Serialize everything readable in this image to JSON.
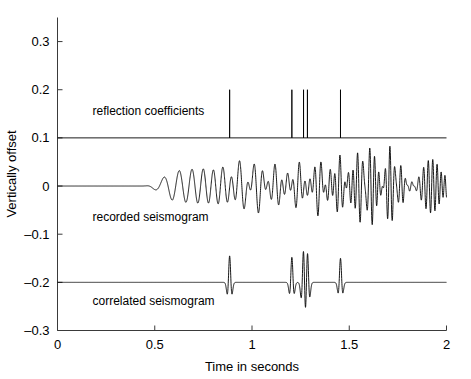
{
  "chart_data": {
    "type": "line",
    "title": "",
    "xlabel": "Time in seconds",
    "ylabel": "Vertically offset",
    "xlim": [
      0,
      2
    ],
    "ylim": [
      -0.3,
      0.35
    ],
    "xticks": [
      0,
      0.5,
      1,
      1.5,
      2
    ],
    "xticklabels": [
      "0",
      "0.5",
      "1",
      "1.5",
      "2"
    ],
    "yticks": [
      0.3,
      0.2,
      0.1,
      0,
      -0.1,
      -0.2,
      -0.3
    ],
    "yticklabels": [
      "0.3",
      "0.2",
      "0.1",
      "0",
      "-0.1",
      "-0.2",
      "-0.3"
    ],
    "grid": false,
    "legend": "none",
    "annotations": [
      {
        "text": "reflection coefficients",
        "x": 0.18,
        "y": 0.148
      },
      {
        "text": "recorded seismogram",
        "x": 0.18,
        "y": -0.072
      },
      {
        "text": "correlated seismogram",
        "x": 0.18,
        "y": -0.247
      }
    ],
    "series": [
      {
        "name": "reflection coefficients",
        "type": "stem",
        "baseline": 0.1,
        "amplitude_scale": 0.1,
        "spikes": [
          {
            "t": 0.885,
            "amp": 1.0
          },
          {
            "t": 1.205,
            "amp": 1.0
          },
          {
            "t": 1.265,
            "amp": 1.0
          },
          {
            "t": 1.285,
            "amp": 1.0
          },
          {
            "t": 1.455,
            "amp": 1.0
          }
        ]
      },
      {
        "name": "recorded seismogram",
        "type": "chirp-convolution",
        "baseline": 0.0,
        "sweep_start": 0.45,
        "sweep_end": 1.86,
        "freq_start": 8,
        "freq_end": 56,
        "envelope_peak_t": 1.3,
        "amplitude": 0.072
      },
      {
        "name": "correlated seismogram",
        "type": "wavelet-train",
        "baseline": -0.2,
        "wavelet_half_width": 0.035,
        "dominant_freq": 32,
        "events": [
          {
            "t": 0.885,
            "amp": 0.055
          },
          {
            "t": 1.205,
            "amp": 0.052
          },
          {
            "t": 1.265,
            "amp": 0.072
          },
          {
            "t": 1.285,
            "amp": 0.068
          },
          {
            "t": 1.455,
            "amp": 0.05
          }
        ]
      }
    ]
  },
  "axes": {
    "x_title": "Time in seconds",
    "y_title": "Vertically offset"
  }
}
